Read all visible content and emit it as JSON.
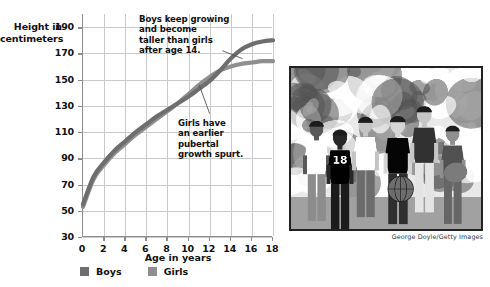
{
  "figure": {
    "y_axis_title_lines": [
      "Height in",
      "centimeters"
    ],
    "x_axis_title": "Age in years"
  },
  "annotations": {
    "boys_note_lines": [
      "Boys keep growing",
      "and become",
      "taller than girls",
      "after age 14."
    ],
    "girls_note_lines": [
      "Girls have",
      "an earlier",
      "pubertal",
      "growth spurt."
    ]
  },
  "legend": {
    "items": [
      {
        "label": "Boys",
        "color": "#6e6e6e"
      },
      {
        "label": "Girls",
        "color": "#8f8f8f"
      }
    ]
  },
  "photo": {
    "caption": "George Doyle/Getty Images",
    "alt_name": "group-of-teenagers-photo"
  },
  "colors": {
    "boys_line": "#6e6e6e",
    "girls_line": "#8f8f8f",
    "grid": "#c9c9c9",
    "axis": "#8d8d8d",
    "text": "#111111",
    "background": "#ffffff"
  },
  "chart_data": {
    "type": "line",
    "title": "",
    "xlabel": "Age in years",
    "ylabel": "Height in centimeters",
    "xlim": [
      0,
      18
    ],
    "ylim": [
      30,
      200
    ],
    "xticks": [
      0,
      2,
      4,
      6,
      8,
      10,
      12,
      14,
      16,
      18
    ],
    "yticks": [
      30,
      50,
      70,
      90,
      110,
      130,
      150,
      170,
      190
    ],
    "grid": true,
    "legend_position": "bottom",
    "x": [
      0,
      1,
      2,
      3,
      4,
      5,
      6,
      7,
      8,
      9,
      10,
      11,
      12,
      13,
      14,
      15,
      16,
      17,
      18
    ],
    "series": [
      {
        "name": "Boys",
        "color": "#6e6e6e",
        "values": [
          55,
          76,
          87,
          96,
          103,
          110,
          116,
          122,
          127,
          132,
          137,
          143,
          149,
          157,
          166,
          173,
          177,
          179,
          180
        ]
      },
      {
        "name": "Girls",
        "color": "#8f8f8f",
        "values": [
          53,
          74,
          85,
          94,
          101,
          108,
          114,
          120,
          126,
          132,
          139,
          146,
          152,
          157,
          160,
          162,
          163,
          164,
          164
        ]
      }
    ],
    "annotations": [
      {
        "text": "Boys keep growing and become taller than girls after age 14.",
        "points_to": {
          "x": 15.0,
          "y": 173
        }
      },
      {
        "text": "Girls have an earlier pubertal growth spurt.",
        "points_to": {
          "x": 11.2,
          "y": 146
        }
      }
    ]
  }
}
